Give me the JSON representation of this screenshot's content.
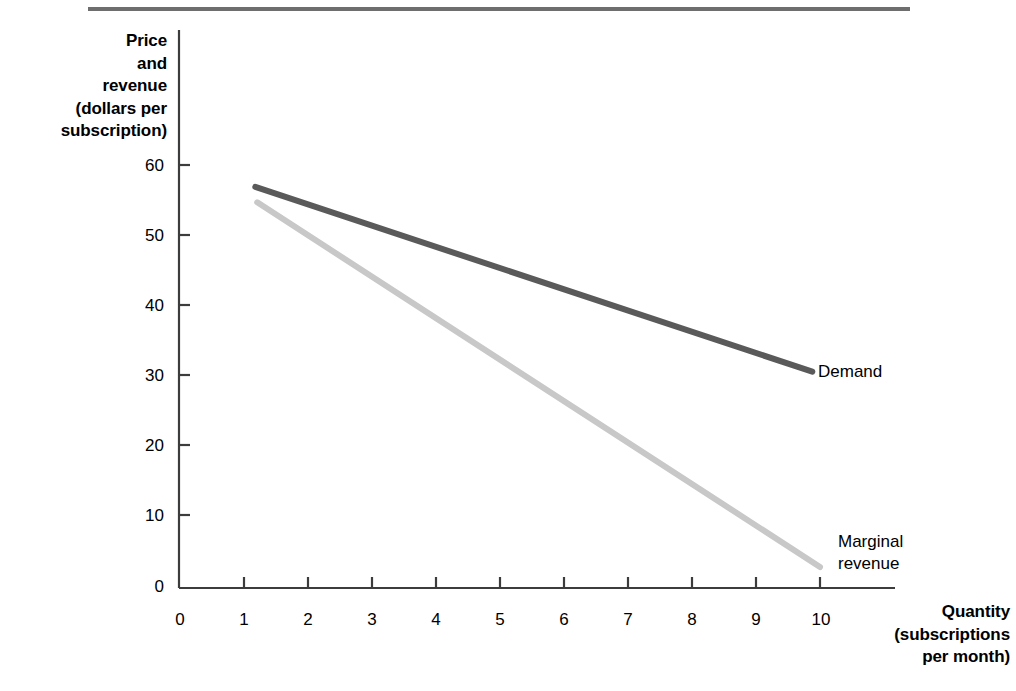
{
  "figure": {
    "has_top_rule": true,
    "background_color": "#ffffff"
  },
  "axes": {
    "y_title_lines": [
      "Price",
      "and",
      "revenue",
      "(dollars per",
      "subscription)"
    ],
    "x_title_lines": [
      "Quantity",
      "(subscriptions",
      "per month)"
    ],
    "y_ticks": [
      "0",
      "10",
      "20",
      "30",
      "40",
      "50",
      "60"
    ],
    "x_ticks": [
      "0",
      "1",
      "2",
      "3",
      "4",
      "5",
      "6",
      "7",
      "8",
      "9",
      "10"
    ]
  },
  "series_labels": {
    "demand": "Demand",
    "marginal_revenue_line1": "Marginal",
    "marginal_revenue_line2": "revenue"
  },
  "chart_data": {
    "type": "line",
    "title": "",
    "subtitle": "",
    "xlabel": "Quantity (subscriptions per month)",
    "ylabel": "Price and revenue (dollars per subscription)",
    "xlim": [
      0,
      11.2
    ],
    "ylim": [
      0,
      63
    ],
    "xticks": [
      0,
      1,
      2,
      3,
      4,
      5,
      6,
      7,
      8,
      9,
      10
    ],
    "yticks": [
      0,
      10,
      20,
      30,
      40,
      50,
      60
    ],
    "grid": false,
    "legend": "inline-curve-labels",
    "series": [
      {
        "name": "Demand",
        "color": "#5a5a5a",
        "linewidth": 5,
        "x": [
          1.19,
          9.88
        ],
        "y": [
          57.3,
          30.9
        ],
        "label_position": {
          "x": 9.98,
          "y": 31.9
        },
        "annotation": "Demand"
      },
      {
        "name": "Marginal revenue",
        "color": "#c8c8c8",
        "linewidth": 5,
        "x": [
          1.22,
          10.0
        ],
        "y": [
          55.1,
          3.0
        ],
        "label_position": {
          "x": 10.28,
          "y": 7.0
        },
        "annotation": "Marginal revenue"
      }
    ]
  }
}
